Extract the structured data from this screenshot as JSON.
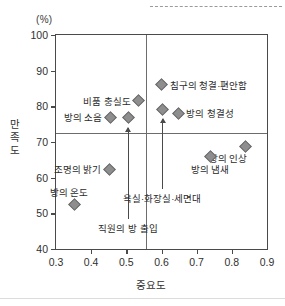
{
  "chart_data": {
    "type": "scatter",
    "title": "",
    "unit_label": "(%)",
    "xlabel": "중요도",
    "ylabel": "만족도",
    "xlim": [
      0.3,
      0.9
    ],
    "ylim": [
      40,
      100
    ],
    "xticks": [
      "0.3",
      "0.4",
      "0.5",
      "0.6",
      "0.7",
      "0.8",
      "0.9"
    ],
    "xtick_values": [
      0.3,
      0.4,
      0.5,
      0.6,
      0.7,
      0.8,
      0.9
    ],
    "yticks": [
      "100",
      "90",
      "80",
      "70",
      "60",
      "50",
      "40"
    ],
    "ytick_values": [
      100,
      90,
      80,
      70,
      60,
      50,
      40
    ],
    "grid": false,
    "legend": "none",
    "quadrant_divider_x": 0.555,
    "quadrant_divider_y": 72.5,
    "points": [
      {
        "label": "비품 충실도",
        "x": 0.535,
        "y": 81.5,
        "label_pos": "left"
      },
      {
        "label": "방의 소음",
        "x": 0.455,
        "y": 77.0,
        "label_pos": "left"
      },
      {
        "label": "직원의 방 출입",
        "x": 0.505,
        "y": 77.0,
        "label_pos": "none"
      },
      {
        "label": "침구의 청결·편안함",
        "x": 0.6,
        "y": 86.0,
        "label_pos": "right"
      },
      {
        "label": "욕실·화장실·세면대",
        "x": 0.602,
        "y": 79.2,
        "label_pos": "none"
      },
      {
        "label": "방의 청결성",
        "x": 0.648,
        "y": 78.0,
        "label_pos": "right"
      },
      {
        "label": "방의 인상",
        "x": 0.838,
        "y": 68.8,
        "label_pos": "left-below"
      },
      {
        "label": "방의 냄새",
        "x": 0.738,
        "y": 66.0,
        "label_pos": "below"
      },
      {
        "label": "조명의 밝기",
        "x": 0.452,
        "y": 62.3,
        "label_pos": "left"
      },
      {
        "label": "방의 온도",
        "x": 0.352,
        "y": 52.5,
        "label_pos": "above-left"
      }
    ],
    "annotations": [
      {
        "text": "직원의 방 출입",
        "x": 0.505,
        "target_y": 74.0,
        "text_y": 48.5
      },
      {
        "text": "욕실·화장실·세면대",
        "x": 0.602,
        "target_y": 76.5,
        "text_y": 56.8
      }
    ],
    "marker_color": "#8e8e8e",
    "axis_color": "#4a4a4a",
    "divider_color": "#6d6d6d"
  }
}
